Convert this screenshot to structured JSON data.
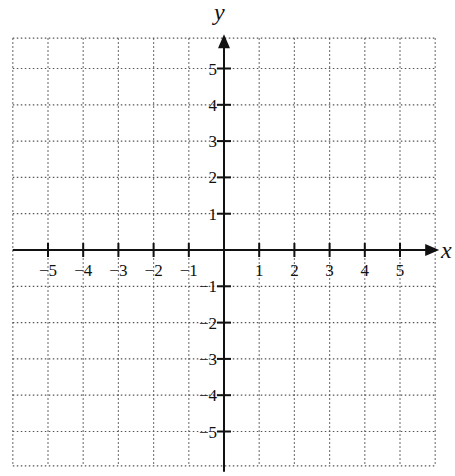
{
  "chart_data": {
    "type": "scatter",
    "title": "",
    "xlabel": "x",
    "ylabel": "y",
    "xlim": [
      -6,
      6
    ],
    "ylim": [
      -6,
      6
    ],
    "grid": true,
    "grid_style": "dotted",
    "x_ticks": [
      -5,
      -4,
      -3,
      -2,
      -1,
      1,
      2,
      3,
      4,
      5
    ],
    "y_ticks": [
      -5,
      -4,
      -3,
      -2,
      -1,
      1,
      2,
      3,
      4,
      5
    ],
    "x_tick_labels": [
      "−5",
      "−4",
      "−3",
      "−2",
      "−1",
      "1",
      "2",
      "3",
      "4",
      "5"
    ],
    "y_tick_labels": [
      "−5",
      "−4",
      "−3",
      "−2",
      "−1",
      "1",
      "2",
      "3",
      "4",
      "5"
    ],
    "series": [],
    "legend": null
  },
  "colors": {
    "axis": "#111111",
    "grid": "#555555",
    "background": "#ffffff"
  }
}
